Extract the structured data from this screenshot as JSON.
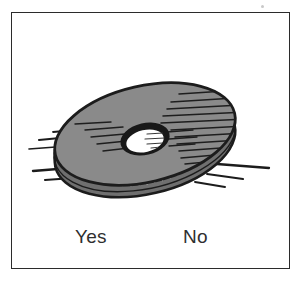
{
  "card": {
    "kind": "illustrated-question-card",
    "background_color": "#ffffff",
    "frame_color": "#2b2b2b"
  },
  "illustration": {
    "subject": "spinning-disc",
    "description": "shaded disc with a central hole, ribbed rim and motion lines",
    "fill_color": "#8a8a8a",
    "rim_color": "#2a2a2a",
    "outline_color": "#1c1c1c",
    "hole_color": "#ffffff",
    "hatching_color": "#1e1e1e",
    "motion_line_color": "#1c1c1c"
  },
  "answers": {
    "yes_label": "Yes",
    "no_label": "No"
  },
  "marks": {
    "speck_color": "#c9c9c9"
  }
}
